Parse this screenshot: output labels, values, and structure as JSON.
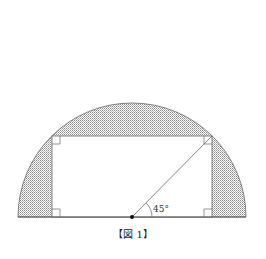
{
  "figure": {
    "caption": "【図 1】",
    "angle_label": "45°",
    "shape": "semicircle with inscribed rectangle",
    "colors": {
      "stroke": "#555555",
      "hatch": "#999999",
      "background": "#ffffff"
    },
    "geometry": {
      "center": [
        132,
        217
      ],
      "radius": 114,
      "rectangle": {
        "x1": 52,
        "x2": 212,
        "y_top": 136,
        "y_bottom": 217
      }
    }
  }
}
